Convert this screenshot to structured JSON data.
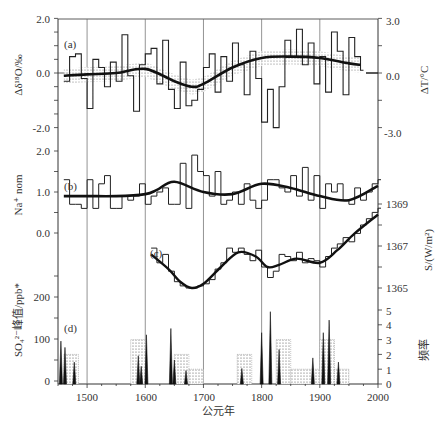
{
  "chart_data": [
    {
      "panel": "(a)",
      "type": "line",
      "ylabel_left": "Δδ¹⁸O/‰",
      "ylabel_right": "ΔT/°C",
      "yticks_left": [
        "2.0",
        "0.0",
        "-2.0"
      ],
      "yticks_right": [
        "3.0",
        "0.0",
        "-3.0"
      ],
      "ylim_left": [
        -2.0,
        2.0
      ],
      "ylim_right": [
        -3.0,
        3.0
      ],
      "series": [
        {
          "name": "smoothed",
          "x": [
            1460,
            1500,
            1550,
            1600,
            1650,
            1680,
            1700,
            1750,
            1800,
            1850,
            1900,
            1950,
            1970
          ],
          "values": [
            -0.1,
            -0.05,
            0.0,
            0.15,
            -0.3,
            -0.5,
            -0.4,
            0.2,
            0.55,
            0.6,
            0.55,
            0.35,
            0.3
          ]
        },
        {
          "name": "raw_step",
          "x": [
            1460,
            1470,
            1480,
            1490,
            1500,
            1510,
            1520,
            1530,
            1540,
            1550,
            1560,
            1570,
            1580,
            1590,
            1600,
            1610,
            1620,
            1630,
            1640,
            1650,
            1660,
            1670,
            1680,
            1690,
            1700,
            1710,
            1720,
            1730,
            1740,
            1750,
            1760,
            1770,
            1780,
            1790,
            1800,
            1810,
            1820,
            1830,
            1840,
            1850,
            1860,
            1870,
            1880,
            1890,
            1900,
            1910,
            1920,
            1930,
            1940,
            1950,
            1960,
            1970
          ],
          "values": [
            -0.3,
            0.6,
            0.7,
            -0.2,
            -1.3,
            0.5,
            0.2,
            -0.5,
            0.4,
            -0.3,
            1.4,
            -0.1,
            -1.4,
            0.3,
            0.7,
            0.9,
            -0.4,
            1.2,
            -0.6,
            -1.3,
            0.4,
            -1.2,
            -1.0,
            -0.6,
            0.2,
            0.7,
            -0.7,
            0.6,
            -0.3,
            1.1,
            0.3,
            -0.8,
            0.8,
            -0.2,
            -1.8,
            -0.6,
            -2.0,
            -0.5,
            1.2,
            0.6,
            1.6,
            0.3,
            1.1,
            -0.4,
            0.6,
            -0.7,
            1.5,
            0.8,
            -0.8,
            1.3,
            0.6,
            0.1
          ]
        }
      ]
    },
    {
      "panel": "(b)",
      "type": "line",
      "ylabel_left": "Na⁺ nom",
      "yticks_left": [
        "2.0",
        "1.0",
        "0.0"
      ],
      "ylim_left": [
        0.0,
        2.0
      ],
      "series": [
        {
          "name": "smoothed",
          "x": [
            1460,
            1500,
            1550,
            1600,
            1620,
            1650,
            1700,
            1750,
            1800,
            1850,
            1900,
            1950,
            2000
          ],
          "values": [
            0.9,
            0.9,
            0.9,
            0.95,
            1.05,
            1.25,
            1.0,
            0.95,
            1.2,
            1.1,
            0.9,
            0.8,
            1.15
          ]
        },
        {
          "name": "raw_step",
          "x": [
            1460,
            1470,
            1480,
            1490,
            1500,
            1510,
            1520,
            1530,
            1540,
            1550,
            1560,
            1570,
            1580,
            1590,
            1600,
            1610,
            1620,
            1630,
            1640,
            1650,
            1660,
            1670,
            1680,
            1690,
            1700,
            1710,
            1720,
            1730,
            1740,
            1750,
            1760,
            1770,
            1780,
            1790,
            1800,
            1810,
            1820,
            1830,
            1840,
            1850,
            1860,
            1870,
            1880,
            1890,
            1900,
            1910,
            1920,
            1930,
            1940,
            1950,
            1960,
            1970,
            1980,
            1990,
            2000
          ],
          "values": [
            1.3,
            0.7,
            0.7,
            0.6,
            1.3,
            0.6,
            1.2,
            1.4,
            0.6,
            0.6,
            0.9,
            0.8,
            0.9,
            1.2,
            0.7,
            0.9,
            1.0,
            1.1,
            0.7,
            0.7,
            1.7,
            0.6,
            1.9,
            1.5,
            1.4,
            0.9,
            1.5,
            0.7,
            0.8,
            1.0,
            0.7,
            1.2,
            0.8,
            0.6,
            0.8,
            1.3,
            1.3,
            1.1,
            1.0,
            1.4,
            0.9,
            1.6,
            0.8,
            1.4,
            0.6,
            1.2,
            1.0,
            1.2,
            0.8,
            0.7,
            1.1,
            0.8,
            1.0,
            1.2,
            1.3
          ]
        }
      ]
    },
    {
      "panel": "(c)",
      "type": "line",
      "ylabel_right": "S/(W/m²)",
      "yticks_right": [
        "1369",
        "1367",
        "1365"
      ],
      "ylim_right": [
        1364.5,
        1369.5
      ],
      "series": [
        {
          "name": "smoothed",
          "x": [
            1610,
            1640,
            1660,
            1680,
            1700,
            1730,
            1760,
            1790,
            1810,
            1830,
            1860,
            1900,
            1930,
            1960,
            2000
          ],
          "values": [
            1366.6,
            1365.9,
            1365.3,
            1365.0,
            1365.2,
            1366.0,
            1366.7,
            1366.5,
            1366.0,
            1366.1,
            1366.4,
            1366.2,
            1366.8,
            1367.6,
            1368.5
          ]
        },
        {
          "name": "raw_step",
          "x": [
            1610,
            1620,
            1630,
            1640,
            1650,
            1660,
            1670,
            1680,
            1690,
            1700,
            1710,
            1720,
            1730,
            1740,
            1750,
            1760,
            1770,
            1780,
            1790,
            1800,
            1810,
            1820,
            1830,
            1840,
            1850,
            1860,
            1870,
            1880,
            1890,
            1900,
            1910,
            1920,
            1930,
            1940,
            1950,
            1960,
            1970,
            1980,
            1990,
            2000
          ],
          "values": [
            1366.9,
            1366.2,
            1366.6,
            1365.8,
            1365.3,
            1365.1,
            1365.0,
            1365.0,
            1365.1,
            1365.2,
            1365.4,
            1365.9,
            1366.2,
            1366.9,
            1366.7,
            1366.9,
            1366.6,
            1366.3,
            1366.8,
            1366.0,
            1365.5,
            1365.8,
            1366.6,
            1366.5,
            1366.3,
            1366.7,
            1366.2,
            1366.4,
            1366.3,
            1366.0,
            1366.5,
            1366.9,
            1367.1,
            1367.4,
            1367.2,
            1367.6,
            1368.0,
            1368.3,
            1368.6,
            1368.8
          ]
        }
      ]
    },
    {
      "panel": "(d)",
      "type": "bar",
      "ylabel_left": "SO₄²⁻峰值/ppb*",
      "ylabel_right": "频率",
      "yticks_left": [
        "200",
        "100",
        "0"
      ],
      "yticks_right": [
        "5",
        "4",
        "3",
        "2",
        "1",
        "0"
      ],
      "ylim_left": [
        0,
        300
      ],
      "ylim_right": [
        0,
        5
      ],
      "spikes": {
        "x": [
          1455,
          1462,
          1478,
          1588,
          1593,
          1602,
          1644,
          1650,
          1670,
          1766,
          1800,
          1815,
          1830,
          1888,
          1906,
          1916,
          1932
        ],
        "values": [
          95,
          80,
          45,
          60,
          35,
          110,
          125,
          50,
          25,
          30,
          115,
          165,
          75,
          55,
          115,
          145,
          45
        ]
      },
      "frequency_blocks": {
        "x_start": [
          1460,
          1575,
          1650,
          1675,
          1758,
          1825,
          1850,
          1900,
          1925
        ],
        "x_end": [
          1485,
          1600,
          1675,
          1700,
          1783,
          1850,
          1900,
          1925,
          1950
        ],
        "values": [
          2,
          3,
          2,
          1,
          2,
          3,
          1,
          3,
          1
        ]
      }
    }
  ],
  "x_axis": {
    "label": "公元年",
    "ticks": [
      "1500",
      "1600",
      "1700",
      "1800",
      "1900",
      "2000"
    ],
    "range": [
      1450,
      2000
    ]
  },
  "labels": {
    "a": "(a)",
    "b": "(b)",
    "c": "(c)",
    "d": "(d)",
    "a_left_title": "Δδ¹⁸O/‰",
    "a_right_title": "ΔT/°C",
    "b_left_title": "Na⁺ nom",
    "c_right_title": "S/(W/m²)",
    "d_left_title": "SO₄²⁻峰值/ppb*",
    "d_right_title": "频率"
  },
  "ticks": {
    "a_left": [
      "2.0",
      "0.0",
      "-2.0"
    ],
    "a_right": [
      "3.0",
      "0.0",
      "-3.0"
    ],
    "b_left": [
      "2.0",
      "1.0",
      "0.0"
    ],
    "c_right": [
      "1369",
      "1367",
      "1365"
    ],
    "d_left": [
      "200",
      "100",
      "0"
    ],
    "d_right": [
      "5",
      "4",
      "3",
      "2",
      "1",
      "0"
    ],
    "x": [
      "1500",
      "1600",
      "1700",
      "1800",
      "1900",
      "2000"
    ]
  }
}
